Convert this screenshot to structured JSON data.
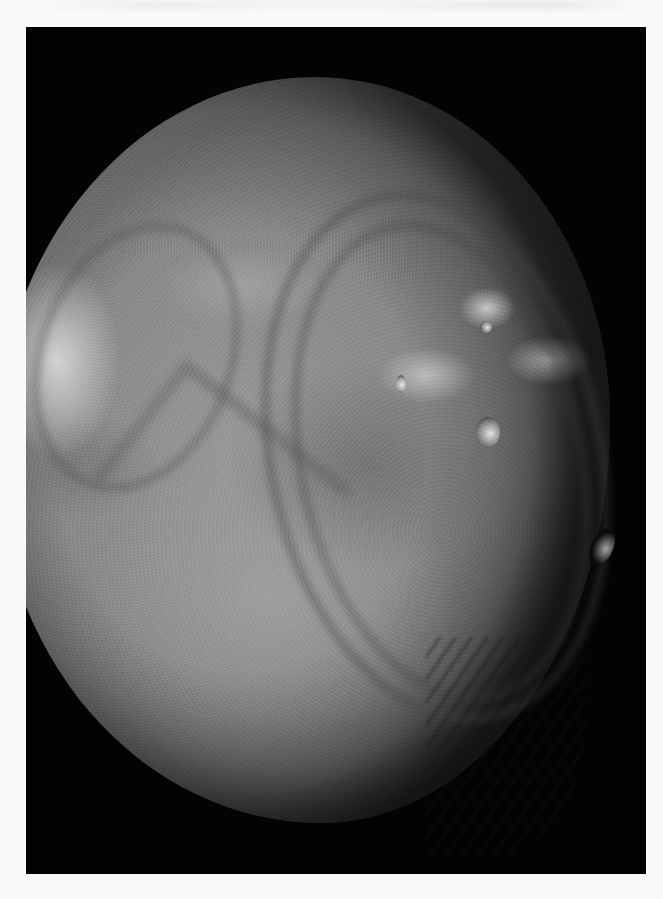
{
  "image": {
    "subject": "Miranda (moon of Uranus)",
    "description": "Black-and-white spacecraft photograph of a heavily cratered, icy moon with grooved, banded terrain and chevron-shaped features, shown against a black sky; scanned from a printed page",
    "background_color": "#030303",
    "page_color": "#fafafa",
    "surface_tone": "#8f8f8f"
  }
}
